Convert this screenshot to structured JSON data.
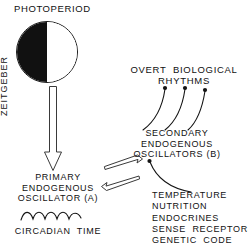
{
  "diagram": {
    "title": "PHOTOPERIOD",
    "nodes": {
      "photoperiod": "PHOTOPERIOD",
      "zeitgeber": "ZEITGEBER",
      "primary_oscillator": "PRIMARY\nENDOGENOUS\nOSCILLATOR (A)",
      "circadian_time": "CIRCADIAN  TIME",
      "secondary_oscillators": "SECONDARY\nENDOGENOUS\nOSCILLATORS (B)",
      "overt_rhythms": "OVERT  BIOLOGICAL\nRHYTHMS",
      "factors": "TEMPERATURE\nNUTRITION\nENDOCRINES\nSENSE  RECEPTORS\nGENETIC  CODE"
    },
    "icons": {
      "photoperiod_circle": "half-dark-circle-icon",
      "zeitgeber_arrow": "hollow-down-arrow-icon",
      "link_arrow": "hollow-double-headed-arrow-icon",
      "rhythm_arrows": "three-curved-up-arrows-icon",
      "factors_arrow": "curved-up-left-arrow-icon",
      "circadian_wave": "sine-wave-icon"
    },
    "colors": {
      "ink": "#141414",
      "background": "#ffffff",
      "hollow_stroke": "#3a3a3a"
    }
  }
}
